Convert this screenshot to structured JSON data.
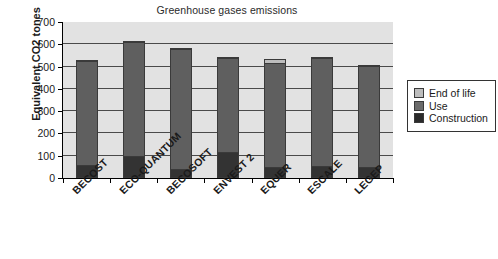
{
  "chart_data": {
    "type": "bar",
    "subtype": "stacked-column",
    "title": "Greenhouse gases emissions",
    "xlabel": "",
    "ylabel": "Equivalent CO2 tones",
    "ylim": [
      0,
      700
    ],
    "ytick_step": 100,
    "yticks": [
      0,
      100,
      200,
      300,
      400,
      500,
      600,
      700
    ],
    "grid": true,
    "legend_position": "right",
    "categories": [
      "BECOST",
      "ECO-QUANTUM",
      "BECOSOFT",
      "ENVEST 2",
      "EQUER",
      "ESCALE",
      "LEGEP"
    ],
    "series": [
      {
        "name": "Construction",
        "color": "#333333",
        "values": [
          50,
          90,
          30,
          110,
          40,
          45,
          40
        ]
      },
      {
        "name": "Use",
        "color": "#5f5f5f",
        "values": [
          480,
          525,
          555,
          435,
          480,
          500,
          465
        ]
      },
      {
        "name": "End of life",
        "color": "#bdbdbd",
        "values": [
          0,
          0,
          0,
          0,
          15,
          0,
          0
        ]
      }
    ],
    "totals": [
      530,
      615,
      585,
      545,
      535,
      545,
      505
    ]
  },
  "legend": {
    "items": [
      {
        "label": "End of life",
        "swatch": "end-of-life-swatch"
      },
      {
        "label": "Use",
        "swatch": "use-swatch"
      },
      {
        "label": "Construction",
        "swatch": "construction-swatch"
      }
    ]
  },
  "colors": {
    "plot_background": "#e2e2e2",
    "gridline": "#4a4a4a",
    "axis": "#000000",
    "end_of_life": "#bdbdbd",
    "use": "#5f5f5f",
    "construction": "#333333"
  }
}
